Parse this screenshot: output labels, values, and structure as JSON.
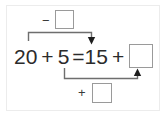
{
  "worksheet": {
    "equation": {
      "left_term": "20",
      "left_operator": "+",
      "left_addend": "5",
      "equals": "=",
      "right_term": "15",
      "right_operator": "+",
      "right_answer_box": ""
    },
    "annotations": {
      "top": {
        "sign": "−",
        "box_value": "",
        "arrow": "down-arrow-icon"
      },
      "bottom": {
        "sign": "+",
        "box_value": "",
        "arrow": "up-arrow-icon"
      }
    },
    "colors": {
      "text": "#2b2b2b",
      "box_border": "#9a9a9a",
      "connector": "#6e6e6e",
      "frame": "#ececec",
      "background": "#ffffff"
    }
  }
}
